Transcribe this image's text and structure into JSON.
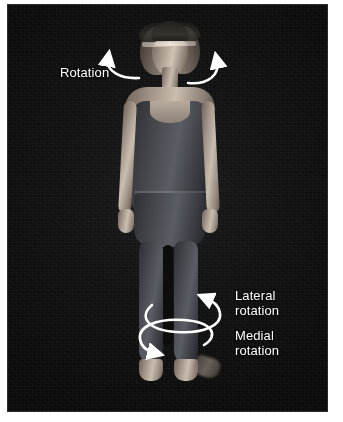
{
  "image": {
    "kind": "anatomy-photograph",
    "subject": "standing adult figure in leotard and tights, multiple-exposure showing rotation",
    "background_color": "#0e0e0e",
    "page_color": "#ffffff",
    "annotation_color": "#ffffff",
    "width": 343,
    "height": 422
  },
  "annotations": [
    {
      "id": "rotation",
      "label": "Rotation",
      "body_part": "head-and-neck",
      "arrows": 2,
      "arrow_names": [
        "head-rotation-arrow-left",
        "head-rotation-arrow-right"
      ]
    },
    {
      "id": "lateral-rotation",
      "label": "Lateral\nrotation",
      "body_part": "lower-limb",
      "arrows": 1,
      "arrow_names": [
        "lateral-rotation-arrow"
      ]
    },
    {
      "id": "medial-rotation",
      "label": "Medial\nrotation",
      "body_part": "lower-limb",
      "arrows": 1,
      "arrow_names": [
        "medial-rotation-arrow"
      ]
    }
  ],
  "figure": {
    "head_exposures": 3,
    "garment": "dark leotard and tights",
    "feet": "bare",
    "eyewear": "glasses"
  }
}
